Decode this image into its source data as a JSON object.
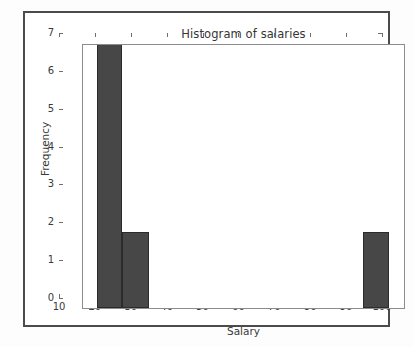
{
  "figure": {
    "background_color": "#fdfdfd",
    "frame_color": "#4b4b4b",
    "axes_color": "#8c8c8c"
  },
  "chart_data": {
    "type": "bar",
    "title": "Histogram of salaries",
    "xlabel": "Salary",
    "ylabel": "Frequency",
    "grid": false,
    "legend": null,
    "bar_color": "#474747",
    "bar_edge_color": "#2b2b2b",
    "xlim": [
      10,
      100
    ],
    "ylim": [
      0,
      7
    ],
    "xticks": [
      10,
      20,
      30,
      40,
      50,
      60,
      70,
      80,
      90,
      100
    ],
    "xtick_labels": [
      "10",
      "20",
      "30",
      "40",
      "50",
      "60",
      "70",
      "80",
      "90",
      "100"
    ],
    "yticks": [
      0,
      1,
      2,
      3,
      4,
      5,
      6,
      7
    ],
    "ytick_labels": [
      "0",
      "1",
      "2",
      "3",
      "4",
      "5",
      "6",
      "7"
    ],
    "bins": [
      {
        "left": 13.9,
        "right": 21.0,
        "value": 7
      },
      {
        "left": 21.0,
        "right": 28.4,
        "value": 2
      },
      {
        "left": 88.0,
        "right": 95.2,
        "value": 2
      }
    ],
    "categories": [
      "13.9-21.0",
      "21.0-28.4",
      "88.0-95.2"
    ],
    "values": [
      7,
      2,
      2
    ]
  }
}
